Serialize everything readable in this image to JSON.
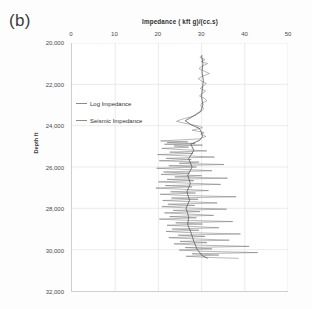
{
  "figure": {
    "panel_label": "(b)",
    "background_color": "#fdfdfd"
  },
  "legend": {
    "position": "inside-top-left",
    "items": [
      {
        "label": "Log Impedance",
        "color": "#8c8c8c",
        "icon": "line-swatch-icon"
      },
      {
        "label": "Seismic Impedance",
        "color": "#8c8c8c",
        "icon": "line-swatch-icon"
      }
    ]
  },
  "chart_data": {
    "type": "line",
    "title": "Impedance ( kft g)/(cc.s)",
    "xlabel": "Impedance ( kft g)/(cc.s)",
    "ylabel": "Depth ft",
    "xlim": [
      0,
      50
    ],
    "ylim": [
      20000,
      32000
    ],
    "y_inverted": true,
    "grid": true,
    "xticks": [
      0,
      10,
      20,
      30,
      40,
      50
    ],
    "xtick_labels": [
      "0",
      "10",
      "20",
      "30",
      "40",
      "50"
    ],
    "yticks": [
      20000,
      22000,
      24000,
      26000,
      28000,
      30000,
      32000
    ],
    "ytick_labels": [
      "20,000",
      "22,000",
      "24,000",
      "26,000",
      "28,000",
      "30,000",
      "32,000"
    ],
    "series": [
      {
        "name": "Log Impedance",
        "color": "#6f6f6f",
        "linewidth": 0.5,
        "description": "High-frequency well log impedance, strongly oscillatory below 24,600 ft with spikes from 18 to 45 kft g/(cc.s)",
        "points": [
          [
            30.2,
            20600
          ],
          [
            29.6,
            20700
          ],
          [
            30.8,
            20800
          ],
          [
            29.9,
            20900
          ],
          [
            31.4,
            21000
          ],
          [
            30.1,
            21120
          ],
          [
            29.4,
            21240
          ],
          [
            30.6,
            21360
          ],
          [
            31.8,
            21480
          ],
          [
            30.3,
            21600
          ],
          [
            29.2,
            21720
          ],
          [
            30.0,
            21840
          ],
          [
            31.1,
            21960
          ],
          [
            30.4,
            22080
          ],
          [
            29.7,
            22200
          ],
          [
            30.9,
            22320
          ],
          [
            30.2,
            22440
          ],
          [
            29.5,
            22560
          ],
          [
            30.7,
            22680
          ],
          [
            31.2,
            22800
          ],
          [
            30.0,
            22920
          ],
          [
            29.8,
            23040
          ],
          [
            30.5,
            23160
          ],
          [
            30.1,
            23280
          ],
          [
            29.3,
            23400
          ],
          [
            28.6,
            23500
          ],
          [
            27.4,
            23580
          ],
          [
            26.1,
            23650
          ],
          [
            25.0,
            23720
          ],
          [
            24.2,
            23790
          ],
          [
            25.6,
            23860
          ],
          [
            27.0,
            23920
          ],
          [
            28.4,
            23980
          ],
          [
            29.6,
            24040
          ],
          [
            30.2,
            24100
          ],
          [
            29.0,
            24160
          ],
          [
            27.8,
            24220
          ],
          [
            29.4,
            24280
          ],
          [
            30.6,
            24340
          ],
          [
            29.8,
            24400
          ],
          [
            30.4,
            24460
          ],
          [
            31.0,
            24520
          ],
          [
            30.2,
            24580
          ],
          [
            29.6,
            24640
          ],
          [
            24.0,
            24700
          ],
          [
            20.5,
            24740
          ],
          [
            26.8,
            24780
          ],
          [
            22.0,
            24820
          ],
          [
            28.5,
            24860
          ],
          [
            21.4,
            24900
          ],
          [
            30.2,
            24940
          ],
          [
            23.6,
            24980
          ],
          [
            27.0,
            25040
          ],
          [
            20.8,
            25100
          ],
          [
            25.4,
            25160
          ],
          [
            31.2,
            25220
          ],
          [
            22.6,
            25280
          ],
          [
            28.0,
            25340
          ],
          [
            19.8,
            25400
          ],
          [
            26.4,
            25460
          ],
          [
            33.0,
            25520
          ],
          [
            21.8,
            25580
          ],
          [
            27.6,
            25640
          ],
          [
            20.2,
            25700
          ],
          [
            29.4,
            25760
          ],
          [
            24.8,
            25820
          ],
          [
            35.2,
            25880
          ],
          [
            22.4,
            25940
          ],
          [
            28.8,
            26000
          ],
          [
            19.6,
            26060
          ],
          [
            26.0,
            26120
          ],
          [
            32.4,
            26180
          ],
          [
            21.2,
            26240
          ],
          [
            27.2,
            26300
          ],
          [
            20.6,
            26360
          ],
          [
            30.0,
            26420
          ],
          [
            23.8,
            26480
          ],
          [
            36.0,
            26540
          ],
          [
            22.0,
            26600
          ],
          [
            28.2,
            26660
          ],
          [
            20.0,
            26720
          ],
          [
            26.6,
            26780
          ],
          [
            34.4,
            26840
          ],
          [
            21.6,
            26900
          ],
          [
            27.8,
            26960
          ],
          [
            19.4,
            27020
          ],
          [
            25.8,
            27080
          ],
          [
            31.6,
            27140
          ],
          [
            22.8,
            27200
          ],
          [
            28.6,
            27260
          ],
          [
            20.4,
            27320
          ],
          [
            26.2,
            27380
          ],
          [
            38.0,
            27440
          ],
          [
            23.0,
            27500
          ],
          [
            29.2,
            27560
          ],
          [
            21.0,
            27620
          ],
          [
            27.4,
            27680
          ],
          [
            33.6,
            27740
          ],
          [
            22.2,
            27800
          ],
          [
            28.4,
            27860
          ],
          [
            20.8,
            27920
          ],
          [
            26.8,
            27980
          ],
          [
            35.8,
            28040
          ],
          [
            23.4,
            28100
          ],
          [
            29.6,
            28160
          ],
          [
            21.4,
            28220
          ],
          [
            27.0,
            28280
          ],
          [
            32.8,
            28340
          ],
          [
            22.6,
            28400
          ],
          [
            28.8,
            28460
          ],
          [
            20.2,
            28520
          ],
          [
            26.4,
            28580
          ],
          [
            37.2,
            28640
          ],
          [
            24.0,
            28700
          ],
          [
            30.2,
            28760
          ],
          [
            22.0,
            28820
          ],
          [
            28.0,
            28880
          ],
          [
            34.0,
            28940
          ],
          [
            23.2,
            29000
          ],
          [
            29.4,
            29060
          ],
          [
            21.8,
            29120
          ],
          [
            27.6,
            29180
          ],
          [
            39.0,
            29240
          ],
          [
            24.6,
            29300
          ],
          [
            30.8,
            29360
          ],
          [
            22.4,
            29420
          ],
          [
            28.6,
            29480
          ],
          [
            36.4,
            29540
          ],
          [
            25.0,
            29600
          ],
          [
            31.2,
            29660
          ],
          [
            23.6,
            29720
          ],
          [
            29.0,
            29780
          ],
          [
            41.0,
            29840
          ],
          [
            26.2,
            29900
          ],
          [
            32.4,
            29960
          ],
          [
            24.8,
            30020
          ],
          [
            30.6,
            30080
          ],
          [
            43.0,
            30140
          ],
          [
            27.8,
            30200
          ],
          [
            34.0,
            30260
          ],
          [
            26.4,
            30320
          ],
          [
            32.0,
            30380
          ],
          [
            38.6,
            30420
          ]
        ]
      },
      {
        "name": "Seismic Impedance",
        "color": "#595959",
        "linewidth": 0.8,
        "description": "Smoothed seismic inversion impedance trend, centered near 30 kft g/(cc.s) in the upper section",
        "points": [
          [
            30.0,
            20600
          ],
          [
            30.3,
            21000
          ],
          [
            30.1,
            21400
          ],
          [
            30.4,
            21800
          ],
          [
            30.2,
            22200
          ],
          [
            30.0,
            22600
          ],
          [
            30.3,
            23000
          ],
          [
            29.8,
            23300
          ],
          [
            28.0,
            23550
          ],
          [
            26.2,
            23760
          ],
          [
            27.6,
            23960
          ],
          [
            29.4,
            24120
          ],
          [
            30.0,
            24320
          ],
          [
            30.2,
            24520
          ],
          [
            29.6,
            24700
          ],
          [
            27.5,
            24900
          ],
          [
            28.2,
            25200
          ],
          [
            27.0,
            25600
          ],
          [
            27.8,
            26000
          ],
          [
            26.8,
            26400
          ],
          [
            27.4,
            26800
          ],
          [
            26.6,
            27200
          ],
          [
            27.2,
            27600
          ],
          [
            26.4,
            28000
          ],
          [
            27.0,
            28400
          ],
          [
            26.8,
            28800
          ],
          [
            27.6,
            29200
          ],
          [
            28.2,
            29600
          ],
          [
            29.0,
            30000
          ],
          [
            30.2,
            30300
          ],
          [
            31.4,
            30420
          ]
        ]
      }
    ]
  }
}
